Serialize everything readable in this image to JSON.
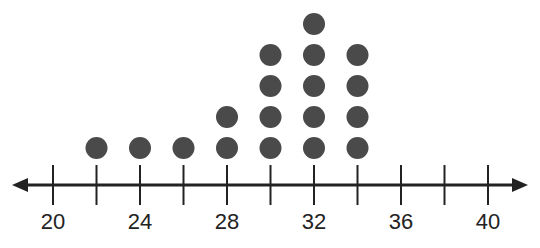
{
  "chart_data": {
    "type": "dot",
    "title": "",
    "xlabel": "",
    "ylabel": "",
    "x_range": [
      20,
      40
    ],
    "tick_step": 2,
    "tick_labels": [
      "20",
      "24",
      "28",
      "32",
      "36",
      "40"
    ],
    "categories": [
      20,
      22,
      24,
      26,
      28,
      30,
      32,
      34,
      36,
      38,
      40
    ],
    "values": [
      0,
      1,
      1,
      1,
      2,
      4,
      5,
      4,
      0,
      0,
      0
    ],
    "grid": false,
    "legend": null,
    "dot_color": "#4a4a4a",
    "axis_color": "#222222"
  }
}
